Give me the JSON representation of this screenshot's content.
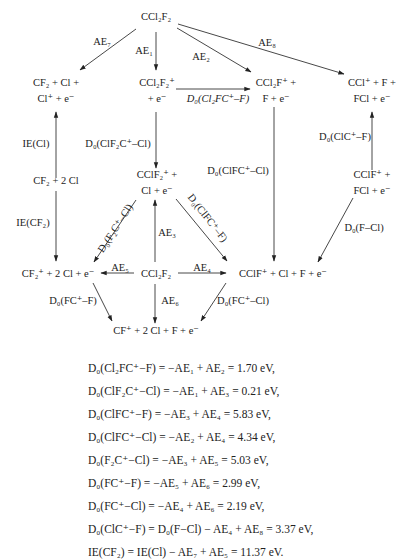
{
  "diagram": {
    "nodes": {
      "top": "CCl₂F₂",
      "n_cf2_cl_clplus_1": "CF₂ + Cl +",
      "n_cf2_cl_clplus_2": "Cl⁺ + e⁻",
      "n_ccl2f2plus_1": "CCl₂F₂⁺",
      "n_ccl2f2plus_2": "+ e⁻",
      "n_ccl2fplus_1": "CCl₂F⁺ +",
      "n_ccl2fplus_2": "F + e⁻",
      "n_cclplus_1": "CCl⁺ + F +",
      "n_cclplus_2": "FCl + e⁻",
      "n_cf2_2cl": "CF₂ + 2 Cl",
      "n_cclf2plus_1": "CClF₂⁺ +",
      "n_cclf2plus_2": "Cl + e⁻",
      "n_cclfplus_fcl_1": "CClF⁺ +",
      "n_cclfplus_fcl_2": "FCl + e⁻",
      "n_cf2plus": "CF₂⁺ + 2 Cl + e⁻",
      "center": "CCl₂F₂",
      "n_cclfplus": "CClF⁺ + Cl + F + e⁻",
      "n_cfplus": "CF⁺ + 2 Cl + F + e⁻"
    },
    "edges": {
      "ae7": "AE₇",
      "ae1": "AE₁",
      "ae2": "AE₂",
      "ae8": "AE₈",
      "d0_cl2fc_f": "D₀(Cl₂FC⁺–F)",
      "ie_cl": "IE(Cl)",
      "d0_clf2c_cl": "D₀(ClF₂C⁺–Cl)",
      "d0_clfc_cl": "D₀(ClFC⁺–Cl)",
      "d0_clc_f": "D₀(ClC⁺–F)",
      "ie_cf2": "IE(CF₂)",
      "d0_f2c_cl": "D₀(F₂C⁺–Cl)",
      "d0_clfc_f": "D₀(ClFC⁺–F)",
      "ae3": "AE₃",
      "d0_f_cl": "D₀(F–Cl)",
      "ae5": "AE₅",
      "ae4": "AE₄",
      "ae6": "AE₆",
      "d0_fc_f": "D₀(FC⁺–F)",
      "d0_fc_cl": "D₀(FC⁺–Cl)"
    }
  },
  "equations": [
    "D₀(Cl₂FC⁺−F) = −AE₁ + AE₂ = 1.70 eV,",
    "D₀(ClF₂C⁺−Cl) = −AE₁ + AE₃ = 0.21 eV,",
    "D₀(ClFC⁺−F) = −AE₃ + AE₄ = 5.83 eV,",
    "D₀(ClFC⁺−Cl) = −AE₂ + AE₄ = 4.34 eV,",
    "D₀(F₂C⁺−Cl) = −AE₃ + AE₅ = 5.03 eV,",
    "D₀(FC⁺−F) = −AE₅ + AE₆ = 2.99 eV,",
    "D₀(FC⁺−Cl) = −AE₄ + AE₆ = 2.19 eV,",
    "D₀(ClC⁺−F) = D₀(F−Cl) − AE₄ + AE₈ = 3.37 eV,",
    "IE(CF₂) = IE(Cl) − AE₇ + AE₅ = 11.37 eV."
  ]
}
